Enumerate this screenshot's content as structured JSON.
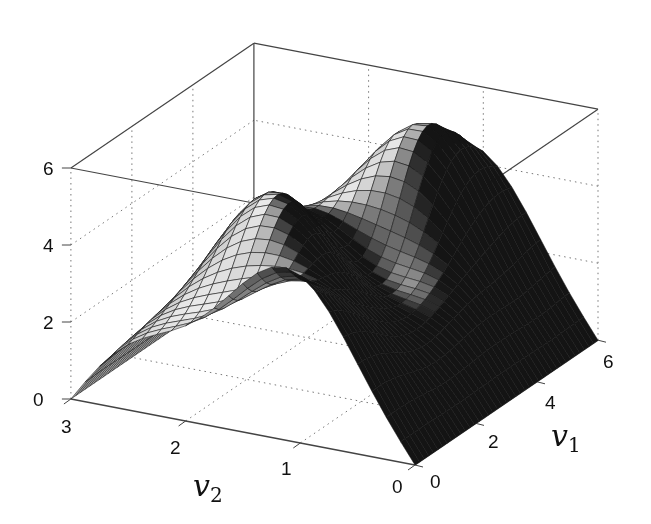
{
  "chart_data": {
    "type": "surface",
    "title": "",
    "xlabel": "v1",
    "ylabel": "v2",
    "zlabel": "",
    "xlim": [
      0,
      6
    ],
    "ylim": [
      0,
      3
    ],
    "zlim": [
      0,
      6
    ],
    "x_ticks": [
      "0",
      "2",
      "4",
      "6"
    ],
    "y_ticks": [
      "0",
      "1",
      "2",
      "3"
    ],
    "z_ticks": [
      "0",
      "2",
      "4",
      "6"
    ],
    "grid": true,
    "colormap": "gray",
    "samples": [
      {
        "v1": 0,
        "v2": 1.5,
        "z": 4.0
      },
      {
        "v1": 1.5,
        "v2": 1.5,
        "z": 2.7
      },
      {
        "v1": 3.0,
        "v2": 1.5,
        "z": 4.5
      },
      {
        "v1": 4.5,
        "v2": 1.0,
        "z": 4.4
      },
      {
        "v1": 6.0,
        "v2": 1.5,
        "z": 4.0
      },
      {
        "v1": 2.0,
        "v2": 2.5,
        "z": 5.5
      },
      {
        "v1": 5.0,
        "v2": 2.3,
        "z": 5.3
      }
    ]
  },
  "axes": {
    "v1_label": "v",
    "v1_sub": "1",
    "v2_label": "v",
    "v2_sub": "2",
    "z_ticks": [
      "0",
      "2",
      "4",
      "6"
    ],
    "v1_ticks": [
      "0",
      "2",
      "4",
      "6"
    ],
    "v2_ticks": [
      "0",
      "1",
      "2",
      "3"
    ]
  }
}
